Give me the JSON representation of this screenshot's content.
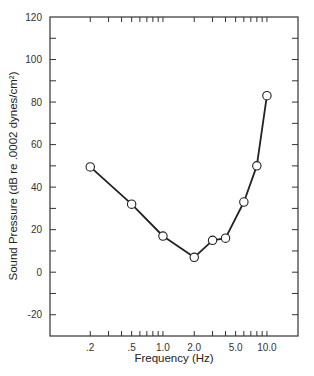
{
  "chart_data": {
    "type": "line",
    "title": "",
    "xlabel": "Frequency (Hz)",
    "ylabel": "Sound Pressure (dB re .0002 dynes/cm²)",
    "xscale": "log",
    "xlim": [
      0.082,
      19.9
    ],
    "ylim": [
      -30,
      120
    ],
    "grid": false,
    "legend": null,
    "x_ticks": [
      {
        "value": 0.2,
        "label": ".2"
      },
      {
        "value": 0.5,
        "label": ".5"
      },
      {
        "value": 1.0,
        "label": "1.0"
      },
      {
        "value": 2.0,
        "label": "2.0"
      },
      {
        "value": 5.0,
        "label": "5.0"
      },
      {
        "value": 10.0,
        "label": "10.0"
      }
    ],
    "x_minor_ticks": [
      0.2,
      0.3,
      0.4,
      0.5,
      0.6,
      0.7,
      0.8,
      0.9,
      1.0,
      2.0,
      3.0,
      4.0,
      5.0,
      6.0,
      7.0,
      8.0,
      9.0,
      10.0
    ],
    "y_ticks": [
      {
        "value": 120,
        "label": "120"
      },
      {
        "value": 100,
        "label": "100"
      },
      {
        "value": 80,
        "label": "80"
      },
      {
        "value": 60,
        "label": "60"
      },
      {
        "value": 40,
        "label": "40"
      },
      {
        "value": 20,
        "label": "20"
      },
      {
        "value": 0,
        "label": "0"
      },
      {
        "value": -20,
        "label": "-20"
      }
    ],
    "y_minor_ticks": [
      110,
      90,
      70,
      50,
      30,
      10,
      -10
    ],
    "series": [
      {
        "name": "Threshold",
        "marker": "open-circle",
        "color": "#222222",
        "x": [
          0.2,
          0.5,
          1.0,
          2.0,
          3.0,
          4.0,
          6.0,
          8.0,
          10.0
        ],
        "values": [
          49.5,
          32,
          17,
          7,
          15,
          16,
          33,
          50,
          83
        ]
      }
    ]
  },
  "colors": {
    "line": "#222222",
    "frame": "#333333",
    "marker_fill": "#ffffff"
  }
}
